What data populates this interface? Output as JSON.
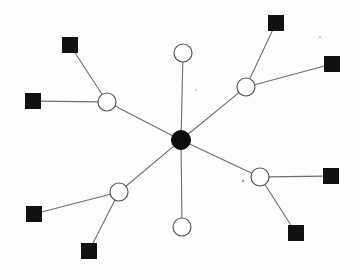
{
  "diagram": {
    "type": "node-link-diagram",
    "canvas": {
      "width": 358,
      "height": 276,
      "background": "#fdfdfd"
    },
    "legend": {
      "hub_label": "central hub node",
      "circle_label": "intermediate node",
      "square_label": "leaf node"
    },
    "styles": {
      "hub_fill": "#0d0d0d",
      "circle_fill": "#ffffff",
      "circle_stroke": "#555555",
      "square_fill": "#111111",
      "edge_color": "#6e6e6e",
      "edge_width": 1.1
    },
    "counts": {
      "hub_nodes": 1,
      "circle_nodes": 6,
      "square_nodes": 8,
      "total_nodes": 15,
      "total_edges": 14
    },
    "nodes": [
      {
        "id": "hub",
        "shape": "circle-filled",
        "label": "",
        "x": 181,
        "y": 140,
        "r": 9.5
      },
      {
        "id": "c-n",
        "shape": "circle-open",
        "label": "",
        "x": 183,
        "y": 53,
        "r": 9.0
      },
      {
        "id": "c-ne",
        "shape": "circle-open",
        "label": "",
        "x": 246,
        "y": 87,
        "r": 9.0
      },
      {
        "id": "c-nw",
        "shape": "circle-open",
        "label": "",
        "x": 107,
        "y": 102,
        "r": 9.0
      },
      {
        "id": "c-sw",
        "shape": "circle-open",
        "label": "",
        "x": 119,
        "y": 192,
        "r": 9.0
      },
      {
        "id": "c-se",
        "shape": "circle-open",
        "label": "",
        "x": 260,
        "y": 177,
        "r": 9.0
      },
      {
        "id": "c-s",
        "shape": "circle-open",
        "label": "",
        "x": 182,
        "y": 227,
        "r": 9.0
      },
      {
        "id": "s-ne1",
        "shape": "square",
        "label": "",
        "x": 276,
        "y": 23,
        "size": 15
      },
      {
        "id": "s-ne2",
        "shape": "square",
        "label": "",
        "x": 332,
        "y": 64,
        "size": 15
      },
      {
        "id": "s-nw1",
        "shape": "square",
        "label": "",
        "x": 70,
        "y": 45,
        "size": 15
      },
      {
        "id": "s-nw2",
        "shape": "square",
        "label": "",
        "x": 33,
        "y": 101,
        "size": 15
      },
      {
        "id": "s-sw1",
        "shape": "square",
        "label": "",
        "x": 34,
        "y": 214,
        "size": 15
      },
      {
        "id": "s-sw2",
        "shape": "square",
        "label": "",
        "x": 89,
        "y": 251,
        "size": 15
      },
      {
        "id": "s-se1",
        "shape": "square",
        "label": "",
        "x": 331,
        "y": 176,
        "size": 15
      },
      {
        "id": "s-se2",
        "shape": "square",
        "label": "",
        "x": 296,
        "y": 233,
        "size": 15
      }
    ],
    "edges": [
      {
        "from": "hub",
        "to": "c-n"
      },
      {
        "from": "hub",
        "to": "c-ne"
      },
      {
        "from": "hub",
        "to": "c-nw"
      },
      {
        "from": "hub",
        "to": "c-sw"
      },
      {
        "from": "hub",
        "to": "c-se"
      },
      {
        "from": "hub",
        "to": "c-s"
      },
      {
        "from": "c-ne",
        "to": "s-ne1"
      },
      {
        "from": "c-ne",
        "to": "s-ne2"
      },
      {
        "from": "c-nw",
        "to": "s-nw1"
      },
      {
        "from": "c-nw",
        "to": "s-nw2"
      },
      {
        "from": "c-sw",
        "to": "s-sw1"
      },
      {
        "from": "c-sw",
        "to": "s-sw2"
      },
      {
        "from": "c-se",
        "to": "s-se1"
      },
      {
        "from": "c-se",
        "to": "s-se2"
      }
    ],
    "specks": [
      {
        "x": 243,
        "y": 181,
        "r": 1.2
      },
      {
        "x": 320,
        "y": 37,
        "r": 0.8
      },
      {
        "x": 196,
        "y": 90,
        "r": 0.7
      }
    ]
  }
}
